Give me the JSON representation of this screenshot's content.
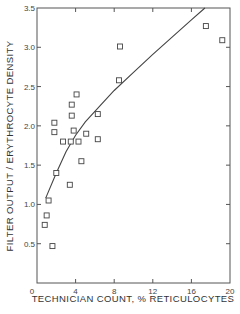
{
  "chart_data": {
    "type": "scatter",
    "title": "",
    "xlabel": "TECHNICIAN COUNT, % RETICULOCYTES",
    "ylabel": "FILTER OUTPUT / ERYTHROCYTE DENSITY",
    "xlim": [
      0,
      20
    ],
    "ylim": [
      0,
      3.5
    ],
    "x_ticks": [
      0,
      4,
      8,
      12,
      16,
      20
    ],
    "x_tick_labels": [
      "0",
      "4",
      "8",
      "12",
      "16",
      "20"
    ],
    "y_ticks": [
      0,
      0.5,
      1.0,
      1.5,
      2.0,
      2.5,
      3.0,
      3.5
    ],
    "y_tick_labels": [
      "0",
      "0.5",
      "1.0",
      "1.5",
      "2.0",
      "2.5",
      "3.0",
      "3.5"
    ],
    "grid": false,
    "legend": null,
    "series": [
      {
        "name": "observations",
        "marker": "open-square",
        "points": [
          [
            0.8,
            0.74
          ],
          [
            1.0,
            0.86
          ],
          [
            1.2,
            1.05
          ],
          [
            1.6,
            0.47
          ],
          [
            1.8,
            2.04
          ],
          [
            1.8,
            1.92
          ],
          [
            2.0,
            1.4
          ],
          [
            2.7,
            1.8
          ],
          [
            3.4,
            1.25
          ],
          [
            3.5,
            1.8
          ],
          [
            3.6,
            2.13
          ],
          [
            3.6,
            2.27
          ],
          [
            3.8,
            1.94
          ],
          [
            4.1,
            2.4
          ],
          [
            4.3,
            1.8
          ],
          [
            4.6,
            1.55
          ],
          [
            5.1,
            1.9
          ],
          [
            6.3,
            2.15
          ],
          [
            6.3,
            1.83
          ],
          [
            8.5,
            2.58
          ],
          [
            8.6,
            3.01
          ],
          [
            17.5,
            3.27
          ],
          [
            19.2,
            3.09
          ]
        ]
      },
      {
        "name": "fitted curve",
        "type": "line",
        "points": [
          [
            0.9,
            1.08
          ],
          [
            2.0,
            1.4
          ],
          [
            3.0,
            1.67
          ],
          [
            4.0,
            1.88
          ],
          [
            5.0,
            2.05
          ],
          [
            6.5,
            2.25
          ],
          [
            8.0,
            2.45
          ],
          [
            10.0,
            2.68
          ],
          [
            12.0,
            2.91
          ],
          [
            14.0,
            3.13
          ],
          [
            16.0,
            3.35
          ],
          [
            17.4,
            3.5
          ]
        ]
      }
    ]
  }
}
